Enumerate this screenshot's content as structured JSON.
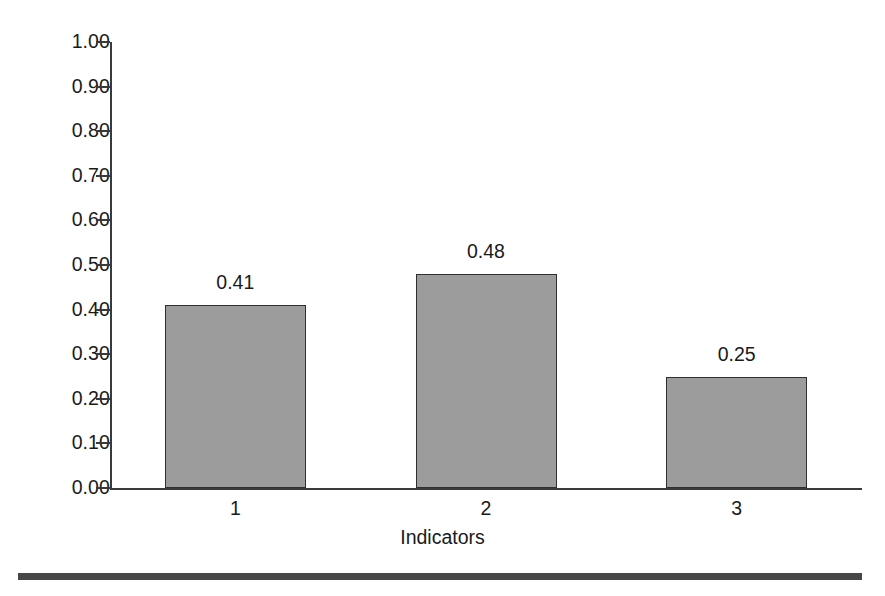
{
  "chart_data": {
    "type": "bar",
    "title": "",
    "subtitle": "",
    "xlabel": "Indicators",
    "ylabel": "",
    "categories": [
      "1",
      "2",
      "3"
    ],
    "values": [
      0.41,
      0.48,
      0.25
    ],
    "value_labels": [
      "0.41",
      "0.48",
      "0.25"
    ],
    "ylim": [
      0.0,
      1.0
    ],
    "y_tick_values": [
      1.0,
      0.9,
      0.8,
      0.7,
      0.6,
      0.5,
      0.4,
      0.3,
      0.2,
      0.1,
      0.0
    ],
    "y_tick_labels": [
      "1.00",
      "0.90",
      "0.80",
      "0.70",
      "0.60",
      "0.50",
      "0.40",
      "0.30",
      "0.20",
      "0.10",
      "0.00"
    ],
    "grid": false,
    "legend": null,
    "legend_position": "none",
    "series": [
      {
        "name": "Indicators",
        "values": [
          0.41,
          0.48,
          0.25
        ]
      }
    ],
    "colors": {
      "bar_fill": "#9c9c9c",
      "bar_border": "#2f2f2f",
      "axis": "#3a3a3a",
      "text": "#1a1a1a",
      "background": "#ffffff",
      "bottom_rule": "#474747"
    }
  },
  "figure": {
    "bottom_rule_present": true
  }
}
